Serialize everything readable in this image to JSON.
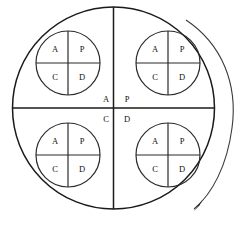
{
  "diagram": {
    "background_color": "#ffffff",
    "line_color": "#1a1a1a",
    "arc_color": "#3a3a3a",
    "outer_circle": {
      "name": "outer-circle",
      "cx": 113.5,
      "cy": 108,
      "r": 101
    },
    "outer_labels": {
      "a": "A",
      "p": "P",
      "c": "C",
      "d": "D"
    },
    "quadrant_labels": [
      "A",
      "P",
      "C",
      "D"
    ],
    "inner_circles": [
      {
        "name": "inner-circle-top-left",
        "position": "top-left",
        "cx": 68,
        "cy": 63,
        "r": 32,
        "labels": {
          "a": "A",
          "p": "P",
          "c": "C",
          "d": "D"
        }
      },
      {
        "name": "inner-circle-top-right",
        "position": "top-right",
        "cx": 168,
        "cy": 63,
        "r": 32,
        "labels": {
          "a": "A",
          "p": "P",
          "c": "C",
          "d": "D"
        }
      },
      {
        "name": "inner-circle-bottom-left",
        "position": "bottom-left",
        "cx": 68,
        "cy": 155,
        "r": 32,
        "labels": {
          "a": "A",
          "p": "P",
          "c": "C",
          "d": "D"
        }
      },
      {
        "name": "inner-circle-bottom-right",
        "position": "bottom-right",
        "cx": 168,
        "cy": 155,
        "r": 32,
        "labels": {
          "a": "A",
          "p": "P",
          "c": "C",
          "d": "D"
        }
      }
    ],
    "rotation_arrow": {
      "name": "rotation-arrow",
      "direction": "clockwise",
      "start": {
        "x": 186,
        "y": 20
      },
      "end": {
        "x": 193,
        "y": 210
      }
    }
  }
}
